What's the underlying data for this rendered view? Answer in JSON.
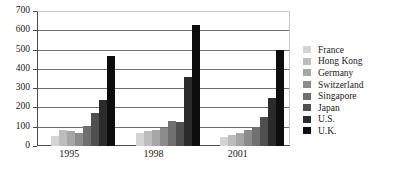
{
  "chart_data": {
    "type": "bar",
    "title": "",
    "subtitle": "",
    "xlabel": "",
    "ylabel": "",
    "categories": [
      "1995",
      "1998",
      "2001"
    ],
    "ylim": [
      0,
      700
    ],
    "yticks": [
      0,
      100,
      200,
      300,
      400,
      500,
      600,
      700
    ],
    "ytick_labels": [
      "0",
      "100",
      "200",
      "300",
      "400",
      "500",
      "600",
      "700"
    ],
    "grid": true,
    "legend_position": "right",
    "series": [
      {
        "name": "France",
        "color": "#d4d4d4",
        "values": [
          50,
          70,
          45
        ]
      },
      {
        "name": "Hong Kong",
        "color": "#bdbdbd",
        "values": [
          85,
          78,
          58
        ]
      },
      {
        "name": "Germany",
        "color": "#a6a6a6",
        "values": [
          78,
          85,
          68
        ]
      },
      {
        "name": "Switzerland",
        "color": "#8c8c8c",
        "values": [
          65,
          92,
          85
        ]
      },
      {
        "name": "Singapore",
        "color": "#707070",
        "values": [
          105,
          128,
          98
        ]
      },
      {
        "name": "Japan",
        "color": "#4f4f4f",
        "values": [
          172,
          124,
          148
        ]
      },
      {
        "name": "U.S.",
        "color": "#2b2b2b",
        "values": [
          240,
          358,
          250
        ]
      },
      {
        "name": "U.K.",
        "color": "#0d0d0d",
        "values": [
          468,
          630,
          498
        ]
      }
    ]
  },
  "legend": {
    "items": [
      {
        "label": "France"
      },
      {
        "label": "Hong Kong"
      },
      {
        "label": "Germany"
      },
      {
        "label": "Switzerland"
      },
      {
        "label": "Singapore"
      },
      {
        "label": "Japan"
      },
      {
        "label": "U.S."
      },
      {
        "label": "U.K."
      }
    ]
  }
}
